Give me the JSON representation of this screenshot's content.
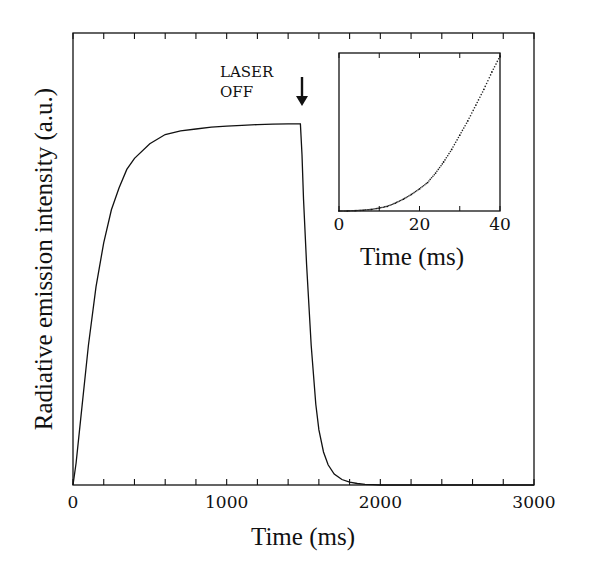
{
  "chart_data": [
    {
      "id": "main",
      "type": "line",
      "title": "",
      "xlabel": "Time (ms)",
      "ylabel": "Radiative emission intensity (a.u.)",
      "xlim": [
        0,
        3000
      ],
      "ylim": [
        0,
        1.0
      ],
      "x_tick_labels": [
        "0",
        "1000",
        "2000",
        "3000"
      ],
      "x_tick_values": [
        0,
        1000,
        2000,
        3000
      ],
      "x_minor_step": 200,
      "y_tick_labels": [],
      "grid": false,
      "annotation": {
        "lines": [
          "LASER",
          "OFF"
        ],
        "x": 1480,
        "arrow": "down"
      },
      "series": [
        {
          "name": "emission",
          "x": [
            0,
            20,
            50,
            100,
            150,
            200,
            250,
            300,
            350,
            400,
            500,
            600,
            700,
            800,
            900,
            1000,
            1100,
            1200,
            1300,
            1400,
            1480,
            1490,
            1500,
            1520,
            1550,
            1580,
            1600,
            1630,
            1660,
            1700,
            1750,
            1800,
            1850,
            1900,
            1950,
            2000,
            2500,
            3000
          ],
          "y": [
            0,
            0.06,
            0.18,
            0.38,
            0.54,
            0.66,
            0.75,
            0.81,
            0.86,
            0.89,
            0.93,
            0.955,
            0.965,
            0.97,
            0.975,
            0.978,
            0.98,
            0.982,
            0.983,
            0.984,
            0.984,
            0.9,
            0.78,
            0.6,
            0.38,
            0.22,
            0.15,
            0.09,
            0.055,
            0.03,
            0.015,
            0.008,
            0.004,
            0.002,
            0.001,
            0,
            0,
            0
          ]
        }
      ]
    },
    {
      "id": "inset",
      "type": "scatter",
      "xlabel": "Time (ms)",
      "ylabel": "",
      "xlim": [
        0,
        40
      ],
      "ylim": [
        0,
        1.0
      ],
      "x_tick_labels": [
        "0",
        "20",
        "40"
      ],
      "x_tick_values": [
        0,
        20,
        40
      ],
      "x_minor_step": 10,
      "grid": false,
      "series": [
        {
          "name": "early-rise",
          "x": [
            0,
            2,
            4,
            6,
            8,
            10,
            12,
            14,
            16,
            18,
            20,
            22,
            24,
            26,
            28,
            30,
            32,
            34,
            36,
            38,
            40
          ],
          "y": [
            0,
            0,
            0.002,
            0.005,
            0.01,
            0.018,
            0.03,
            0.05,
            0.075,
            0.105,
            0.14,
            0.18,
            0.24,
            0.31,
            0.39,
            0.48,
            0.57,
            0.67,
            0.77,
            0.88,
            0.98
          ]
        }
      ]
    }
  ]
}
